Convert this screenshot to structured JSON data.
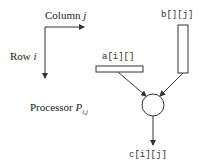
{
  "diagram": {
    "axes": {
      "column_label": "Column ",
      "column_var": "j",
      "row_label": "Row ",
      "row_var": "i"
    },
    "inputs": {
      "a_label": "a[i][]",
      "b_label": "b[][j]"
    },
    "processor": {
      "label": "Processor ",
      "symbol": "P",
      "subscript": "i,j"
    },
    "output": {
      "c_label": "c[i][j]"
    },
    "colors": {
      "stroke": "#333333",
      "text": "#222222",
      "background": "#ffffff"
    }
  }
}
